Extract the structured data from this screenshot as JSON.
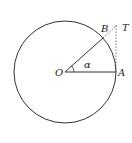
{
  "diagram": {
    "type": "unit-circle-tangent",
    "circle": {
      "cx": 65,
      "cy": 72,
      "r": 51
    },
    "points": {
      "O": {
        "label": "O",
        "x": 65,
        "y": 72
      },
      "A": {
        "label": "A",
        "x": 116,
        "y": 72
      },
      "B": {
        "label": "B",
        "x": 103,
        "y": 38
      },
      "T": {
        "label": "T",
        "x": 116,
        "y": 25
      }
    },
    "angle_label": "α",
    "colors": {
      "stroke": "#333333",
      "background": "#ffffff"
    }
  }
}
